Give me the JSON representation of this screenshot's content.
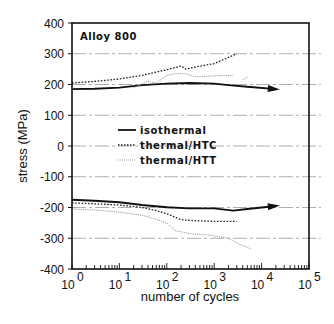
{
  "chart_data": {
    "type": "line",
    "title": "",
    "annotation": "Alloy 800",
    "xlabel": "number of cycles",
    "ylabel": "stress (MPa)",
    "xscale": "log",
    "xlim": [
      1,
      100000
    ],
    "ylim": [
      -400,
      400
    ],
    "x_tick_labels": [
      "10^0",
      "10^1",
      "10^2",
      "10^3",
      "10^4",
      "10^5"
    ],
    "x_tick_bases": [
      "10",
      "10",
      "10",
      "10",
      "10",
      "10"
    ],
    "x_tick_exps": [
      "0",
      "1",
      "2",
      "3",
      "4",
      "5"
    ],
    "y_ticks": [
      400,
      300,
      200,
      100,
      0,
      -100,
      -200,
      -300,
      -400
    ],
    "y_tick_labels": [
      "400",
      "300",
      "200",
      "100",
      "0",
      "-100",
      "-200",
      "-300",
      "-400"
    ],
    "grid": "horizontal dashed at each 100 MPa",
    "legend_position": "inside center-left",
    "series": [
      {
        "name": "isothermal",
        "style": "solid-thick",
        "branches": [
          {
            "part": "tension",
            "x": [
              1,
              3,
              10,
              30,
              100,
              300,
              1000,
              2000,
              5000,
              20000
            ],
            "y": [
              185,
              186,
              190,
              198,
              203,
              205,
              203,
              198,
              193,
              185
            ],
            "arrow_end": true
          },
          {
            "part": "compression",
            "x": [
              1,
              3,
              10,
              30,
              100,
              300,
              1000,
              2500,
              5000,
              20000
            ],
            "y": [
              -175,
              -178,
              -183,
              -192,
              -199,
              -203,
              -203,
              -210,
              -205,
              -195
            ],
            "arrow_end": true
          }
        ]
      },
      {
        "name": "thermal/HTC",
        "style": "dotted",
        "branches": [
          {
            "part": "tension",
            "x": [
              1,
              3,
              10,
              30,
              100,
              200,
              250,
              400,
              1000,
              3000
            ],
            "y": [
              205,
              210,
              218,
              230,
              248,
              260,
              250,
              257,
              268,
              300
            ]
          },
          {
            "part": "compression",
            "x": [
              1,
              3,
              10,
              30,
              60,
              100,
              200,
              400,
              1000,
              3000
            ],
            "y": [
              -185,
              -188,
              -192,
              -200,
              -210,
              -220,
              -240,
              -243,
              -245,
              -245
            ]
          }
        ]
      },
      {
        "name": "thermal/HTT",
        "style": "dotted-light",
        "branches": [
          {
            "part": "tension",
            "x": [
              20,
              40,
              60,
              100,
              150,
              250,
              400,
              1000,
              2500
            ],
            "y": [
              190,
              210,
              205,
              230,
              235,
              235,
              225,
              228,
              230
            ]
          },
          {
            "part": "tension-fragment",
            "x": [
              4000,
              5000
            ],
            "y": [
              215,
              225
            ]
          },
          {
            "part": "compression",
            "x": [
              1,
              3,
              10,
              30,
              50,
              100,
              150,
              300,
              800,
              2000,
              3000,
              6000
            ],
            "y": [
              -205,
              -208,
              -215,
              -225,
              -235,
              -250,
              -275,
              -285,
              -290,
              -300,
              -315,
              -335
            ]
          }
        ]
      }
    ]
  },
  "legend": {
    "items": [
      {
        "label": "isothermal",
        "style": "solid"
      },
      {
        "label": "thermal/HTC",
        "style": "dotted"
      },
      {
        "label": "thermal/HTT",
        "style": "dotted-light"
      }
    ]
  },
  "colors": {
    "axis": "#111111",
    "grid": "#9a9a9a",
    "isothermal": "#111111",
    "htc": "#222222",
    "htt": "#999999"
  }
}
